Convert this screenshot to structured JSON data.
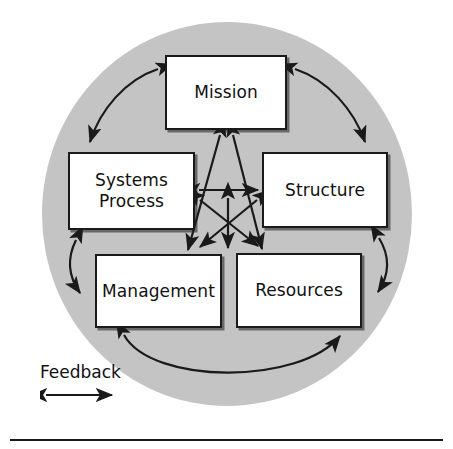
{
  "diagram": {
    "background_color": "#ffffff",
    "circle": {
      "fill_color": "#c4c4c4",
      "center_x": 227,
      "center_y": 214,
      "radius_x": 185,
      "radius_y": 192
    },
    "line_color": "#1a1a1a",
    "nodes": [
      {
        "id": "mission",
        "label": "Mission"
      },
      {
        "id": "systems",
        "label": "Systems\nProcess"
      },
      {
        "id": "structure",
        "label": "Structure"
      },
      {
        "id": "management",
        "label": "Management"
      },
      {
        "id": "resources",
        "label": "Resources"
      }
    ],
    "legend": {
      "label": "Feedback",
      "arrow": "double-headed-arrow"
    },
    "connections": {
      "outer_arcs": [
        {
          "from": "mission",
          "to": "systems",
          "style": "double-headed-curved"
        },
        {
          "from": "mission",
          "to": "structure",
          "style": "double-headed-curved"
        },
        {
          "from": "systems",
          "to": "management",
          "style": "double-headed-curved"
        },
        {
          "from": "structure",
          "to": "resources",
          "style": "double-headed-curved"
        },
        {
          "from": "management",
          "to": "resources",
          "style": "double-headed-curved"
        }
      ],
      "inner_arrows": [
        {
          "from": "systems",
          "to": "structure",
          "style": "double-headed-straight"
        },
        {
          "from": "mission",
          "to": "management",
          "style": "double-headed-straight"
        },
        {
          "from": "mission",
          "to": "resources",
          "style": "double-headed-straight"
        },
        {
          "from": "systems",
          "to": "resources",
          "style": "double-headed-straight"
        },
        {
          "from": "structure",
          "to": "management",
          "style": "double-headed-straight"
        },
        {
          "from": "management",
          "to": "resources",
          "style": "double-headed-straight"
        }
      ]
    }
  }
}
